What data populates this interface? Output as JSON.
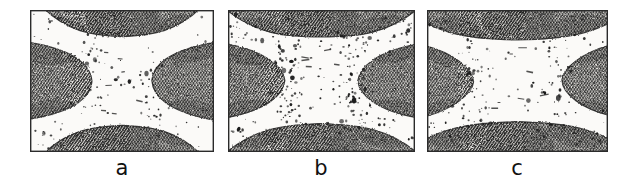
{
  "figure": {
    "type": "scanned-halftone-figure",
    "caption_labels": [
      "a",
      "b",
      "c"
    ],
    "background_color": "#ffffff",
    "ink_color": "#1a1a1a",
    "panel_border_color": "#2b2b2b",
    "hatch_color": "#262626",
    "speckle_color": "#1a1a1a",
    "panel_count": 3
  },
  "panels": [
    {
      "id": "a",
      "label": "a",
      "x": 30,
      "y": 10,
      "width": 184,
      "height": 142,
      "label_x": 122,
      "label_y": 170,
      "waist_half_width": 30,
      "waist_half_height": 46,
      "speckle_density": "low",
      "hatch_angle_deg": 35,
      "hatch_spacing_px": 2.4,
      "notes": "narrowest waist; faint vertical dotted traces in the light central band"
    },
    {
      "id": "b",
      "label": "b",
      "x": 228,
      "y": 10,
      "width": 187,
      "height": 142,
      "label_x": 321,
      "label_y": 170,
      "waist_half_width": 37,
      "waist_half_height": 44,
      "speckle_density": "high",
      "hatch_angle_deg": 35,
      "hatch_spacing_px": 2.4,
      "notes": "heaviest speckling; bowtie arms thicker, corner lobes retracted"
    },
    {
      "id": "c",
      "label": "c",
      "x": 427,
      "y": 10,
      "width": 181,
      "height": 142,
      "label_x": 517,
      "label_y": 170,
      "waist_half_width": 44,
      "waist_half_height": 42,
      "speckle_density": "medium",
      "hatch_angle_deg": 35,
      "hatch_spacing_px": 2.4,
      "notes": "widest waist; light region most open at centre"
    }
  ]
}
